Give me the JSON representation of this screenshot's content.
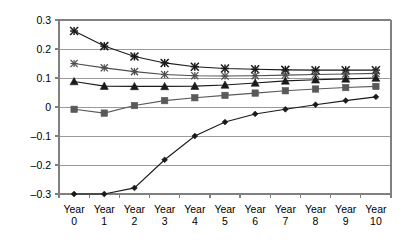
{
  "chart_data": {
    "type": "line",
    "title": "",
    "subtitle": "",
    "xlabel": "",
    "ylabel": "",
    "categories": [
      "Year 0",
      "Year 1",
      "Year 2",
      "Year 3",
      "Year 4",
      "Year 5",
      "Year 6",
      "Year 7",
      "Year 8",
      "Year 9",
      "Year 10"
    ],
    "x": [
      0,
      1,
      2,
      3,
      4,
      5,
      6,
      7,
      8,
      9,
      10
    ],
    "xtick_labels": [
      {
        "line1": "Year",
        "line2": "0"
      },
      {
        "line1": "Year",
        "line2": "1"
      },
      {
        "line1": "Year",
        "line2": "2"
      },
      {
        "line1": "Year",
        "line2": "3"
      },
      {
        "line1": "Year",
        "line2": "4"
      },
      {
        "line1": "Year",
        "line2": "5"
      },
      {
        "line1": "Year",
        "line2": "6"
      },
      {
        "line1": "Year",
        "line2": "7"
      },
      {
        "line1": "Year",
        "line2": "8"
      },
      {
        "line1": "Year",
        "line2": "9"
      },
      {
        "line1": "Year",
        "line2": "10"
      }
    ],
    "ytick_labels": [
      "0.3",
      "0.2",
      "0.1",
      "0",
      "–0.1",
      "–0.2",
      "–0.3"
    ],
    "ytick_values": [
      0.3,
      0.2,
      0.1,
      0,
      -0.1,
      -0.2,
      -0.3
    ],
    "ylim": [
      -0.3,
      0.3
    ],
    "xlim": [
      0,
      10
    ],
    "grid": true,
    "grid_axis": "y",
    "legend": false,
    "legend_position": "none",
    "series": [
      {
        "name": "series-star",
        "marker": "star",
        "color": "#1a1a1a",
        "values": [
          0.262,
          0.21,
          0.174,
          0.152,
          0.139,
          0.133,
          0.13,
          0.128,
          0.127,
          0.127,
          0.127
        ]
      },
      {
        "name": "series-cross",
        "marker": "cross",
        "color": "#4d4d4d",
        "values": [
          0.15,
          0.135,
          0.122,
          0.112,
          0.108,
          0.107,
          0.108,
          0.11,
          0.112,
          0.114,
          0.116
        ]
      },
      {
        "name": "series-triangle",
        "marker": "triangle",
        "color": "#1a1a1a",
        "values": [
          0.088,
          0.072,
          0.071,
          0.071,
          0.072,
          0.076,
          0.083,
          0.09,
          0.094,
          0.097,
          0.1
        ]
      },
      {
        "name": "series-square",
        "marker": "square",
        "color": "#595959",
        "values": [
          -0.008,
          -0.021,
          0.005,
          0.022,
          0.032,
          0.04,
          0.048,
          0.056,
          0.062,
          0.067,
          0.071
        ]
      },
      {
        "name": "series-diamond",
        "marker": "diamond",
        "color": "#1a1a1a",
        "values": [
          -0.3,
          -0.3,
          -0.279,
          -0.182,
          -0.1,
          -0.052,
          -0.024,
          -0.008,
          0.008,
          0.022,
          0.035
        ]
      }
    ]
  },
  "plot": {
    "axis_color": "#808080",
    "grid_color": "#9a9a9a",
    "background": "#ffffff"
  }
}
